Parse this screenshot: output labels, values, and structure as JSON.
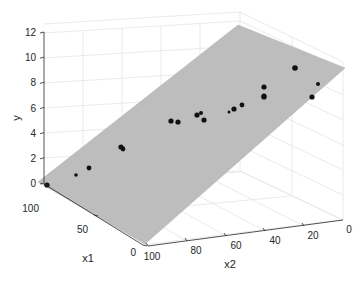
{
  "chart_data": {
    "type": "scatter",
    "subtype": "3d-scatter-with-regression-plane",
    "title": "",
    "xlabel": "x1",
    "ylabel": "x2",
    "zlabel": "y",
    "x1_ticks": [
      "0",
      "50",
      "100"
    ],
    "x2_ticks": [
      "0",
      "20",
      "40",
      "60",
      "80",
      "100"
    ],
    "y_ticks": [
      "0",
      "2",
      "4",
      "6",
      "8",
      "10",
      "12"
    ],
    "x1_range": [
      0,
      100
    ],
    "x2_range": [
      0,
      100
    ],
    "y_range": [
      0,
      12
    ],
    "grid": true,
    "plane_color": "#bdbdbd",
    "point_color": "#111111",
    "points_screen": [
      {
        "x": 47,
        "y": 185,
        "r": 2.6
      },
      {
        "x": 76,
        "y": 175,
        "r": 1.8
      },
      {
        "x": 89,
        "y": 168,
        "r": 2.4
      },
      {
        "x": 121,
        "y": 147,
        "r": 2.6
      },
      {
        "x": 123,
        "y": 149,
        "r": 2.4
      },
      {
        "x": 171,
        "y": 121,
        "r": 2.6
      },
      {
        "x": 178,
        "y": 122,
        "r": 2.6
      },
      {
        "x": 197,
        "y": 115,
        "r": 2.6
      },
      {
        "x": 201,
        "y": 113,
        "r": 2.0
      },
      {
        "x": 204,
        "y": 120,
        "r": 2.6
      },
      {
        "x": 229,
        "y": 112,
        "r": 1.5
      },
      {
        "x": 234,
        "y": 109,
        "r": 2.6
      },
      {
        "x": 242,
        "y": 105,
        "r": 2.4
      },
      {
        "x": 264,
        "y": 97,
        "r": 2.6
      },
      {
        "x": 264,
        "y": 87,
        "r": 2.6
      },
      {
        "x": 264,
        "y": 96,
        "r": 2.6
      },
      {
        "x": 295,
        "y": 68,
        "r": 2.8
      },
      {
        "x": 312,
        "y": 97,
        "r": 2.6
      },
      {
        "x": 318,
        "y": 84,
        "r": 2.0
      }
    ],
    "plane_corners_screen": [
      [
        238,
        25
      ],
      [
        345,
        68
      ],
      [
        145,
        244
      ],
      [
        38,
        182
      ]
    ]
  },
  "labels": {
    "x1": "x1",
    "x2": "x2",
    "y": "y"
  }
}
